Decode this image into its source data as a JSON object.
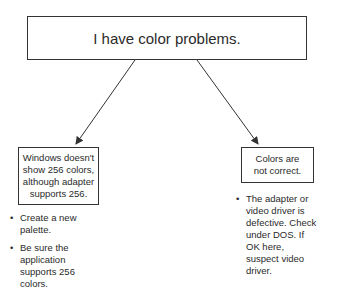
{
  "root": {
    "label": "I have color problems."
  },
  "branches": [
    {
      "label": "Windows doesn't show 256 colors, although adapter supports 256.",
      "steps": [
        "Create a new palette.",
        "Be sure the application supports 256 colors."
      ]
    },
    {
      "label": "Colors are not correct.",
      "steps": [
        "The adapter or video driver is defective. Check under DOS.  If OK here, suspect video driver."
      ]
    }
  ]
}
